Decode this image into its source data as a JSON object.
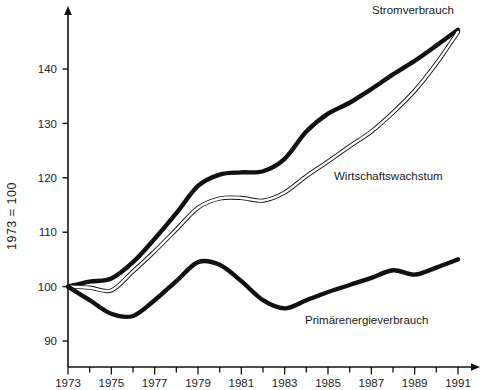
{
  "figure": {
    "title_clipped": "",
    "background": "#ffffff",
    "ink_color": "#111111"
  },
  "axes": {
    "y_axis_title": "1973 = 100",
    "y_ticks": [
      90,
      100,
      110,
      120,
      130,
      140
    ],
    "y_tick_labels": [
      "90",
      "100",
      "110",
      "120",
      "130",
      "140"
    ],
    "x_tick_labels": [
      "1973",
      "1975",
      "1977",
      "1979",
      "1981",
      "1983",
      "1985",
      "1987",
      "1989",
      "1991"
    ],
    "x_minor_years": [
      1974,
      1976,
      1978,
      1980,
      1982,
      1984,
      1986,
      1988,
      1990
    ],
    "x_has_arrow": true,
    "y_has_arrow": true
  },
  "chart_data": {
    "type": "line",
    "title": "",
    "xlabel": "",
    "ylabel": "1973 = 100",
    "xlim": [
      1973,
      1991
    ],
    "ylim": [
      87,
      149
    ],
    "grid": false,
    "legend": "inline-annotations",
    "x": [
      1973,
      1974,
      1975,
      1976,
      1977,
      1978,
      1979,
      1980,
      1981,
      1982,
      1983,
      1984,
      1985,
      1986,
      1987,
      1988,
      1989,
      1990,
      1991
    ],
    "series": [
      {
        "name": "Stromverbrauch",
        "style": "thick-solid",
        "color": "#111111",
        "label_position": "top-right",
        "values": [
          100.0,
          100.9,
          101.5,
          104.5,
          108.8,
          113.5,
          118.5,
          120.6,
          121.0,
          121.2,
          123.5,
          128.5,
          131.8,
          133.8,
          136.3,
          139.0,
          141.5,
          144.3,
          147.2
        ]
      },
      {
        "name": "Wirtschaftswachstum",
        "style": "thin-double",
        "color": "#111111",
        "label_position": "middle-right",
        "values": [
          100.0,
          99.8,
          99.3,
          102.8,
          106.5,
          110.5,
          114.5,
          116.2,
          116.3,
          115.8,
          117.3,
          120.3,
          123.0,
          125.8,
          128.5,
          132.0,
          136.0,
          141.0,
          146.8
        ]
      },
      {
        "name": "Primärenergieverbrauch",
        "style": "thick-solid",
        "color": "#111111",
        "label_position": "bottom-right",
        "values": [
          100.0,
          97.5,
          95.0,
          94.6,
          97.5,
          101.0,
          104.5,
          104.0,
          101.0,
          97.5,
          96.0,
          97.5,
          99.0,
          100.3,
          101.6,
          103.0,
          102.2,
          103.5,
          105.0
        ]
      }
    ]
  },
  "annotations": {
    "stromverbrauch": "Stromverbrauch",
    "wirtschaftswachstum": "Wirtschaftswachstum",
    "primaerenergieverbrauch": "Primärenergieverbrauch"
  }
}
